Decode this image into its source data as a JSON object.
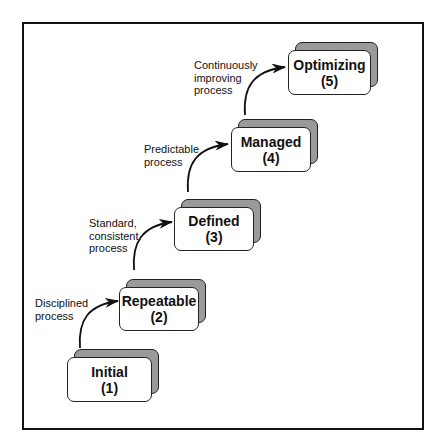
{
  "title": "",
  "stages": [
    {
      "name": "Initial",
      "level": "(1)"
    },
    {
      "name": "Repeatable",
      "level": "(2)"
    },
    {
      "name": "Defined",
      "level": "(3)"
    },
    {
      "name": "Managed",
      "level": "(4)"
    },
    {
      "name": "Optimizing",
      "level": "(5)"
    }
  ],
  "transitions": [
    {
      "from": "Initial",
      "to": "Repeatable",
      "label": "Disciplined\nprocess"
    },
    {
      "from": "Repeatable",
      "to": "Defined",
      "label": "Standard,\nconsistent\nprocess"
    },
    {
      "from": "Defined",
      "to": "Managed",
      "label": "Predictable\nprocess"
    },
    {
      "from": "Managed",
      "to": "Optimizing",
      "label": "Continuously\nimproving\nprocess"
    }
  ],
  "colors": {
    "frame": "#111111",
    "box_fill": "#ffffff",
    "box_shadow": "#9a9a9a",
    "arrow": "#111111"
  }
}
